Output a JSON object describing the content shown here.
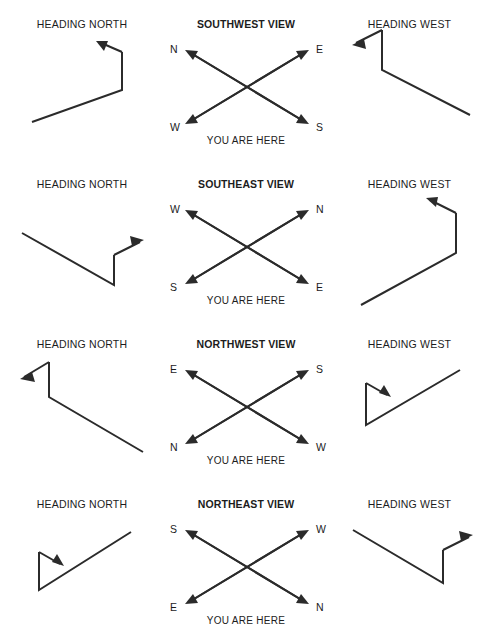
{
  "page": {
    "width": 491,
    "height": 634,
    "background": "#ffffff",
    "stroke_color": "#2b2b2b",
    "text_color": "#1c1c1c"
  },
  "shared": {
    "left_caption": "HEADING NORTH",
    "right_caption": "HEADING WEST",
    "you_are_here": "YOU ARE HERE"
  },
  "rows": [
    {
      "left_caption": "HEADING NORTH",
      "center_title": "SOUTHWEST VIEW",
      "right_caption": "HEADING WEST",
      "you_are_here": "YOU ARE HERE",
      "compass": {
        "top_left": "N",
        "top_right": "E",
        "bottom_left": "W",
        "bottom_right": "S"
      },
      "left_figure": "bent-path-up-left-arrow",
      "right_figure": "bent-path-up-left-arrow"
    },
    {
      "left_caption": "HEADING NORTH",
      "center_title": "SOUTHEAST VIEW",
      "right_caption": "HEADING WEST",
      "you_are_here": "YOU ARE HERE",
      "compass": {
        "top_left": "W",
        "top_right": "N",
        "bottom_left": "S",
        "bottom_right": "E"
      },
      "left_figure": "bent-path-up-right-arrow",
      "right_figure": "bent-path-up-left-arrow"
    },
    {
      "left_caption": "HEADING NORTH",
      "center_title": "NORTHWEST VIEW",
      "right_caption": "HEADING WEST",
      "you_are_here": "YOU ARE HERE",
      "compass": {
        "top_left": "E",
        "top_right": "S",
        "bottom_left": "N",
        "bottom_right": "W"
      },
      "left_figure": "bent-path-up-left-arrow",
      "right_figure": "triangle-loop-down-right-arrow"
    },
    {
      "left_caption": "HEADING NORTH",
      "center_title": "NORTHEAST VIEW",
      "right_caption": "HEADING WEST",
      "you_are_here": "YOU ARE HERE",
      "compass": {
        "top_left": "S",
        "top_right": "W",
        "bottom_left": "E",
        "bottom_right": "N"
      },
      "left_figure": "triangle-loop-down-right-arrow",
      "right_figure": "bent-path-up-right-arrow"
    }
  ]
}
